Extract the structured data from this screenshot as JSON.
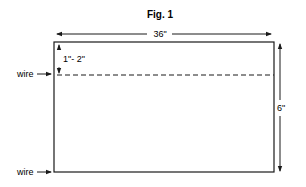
{
  "figure": {
    "title": "Fig. 1",
    "width_label": "36\"",
    "height_label": "6\"",
    "offset_label": "1\"- 2\"",
    "wire_labels": [
      "wire",
      "wire"
    ]
  },
  "colors": {
    "line": "#1a1a1a",
    "background": "#ffffff"
  }
}
